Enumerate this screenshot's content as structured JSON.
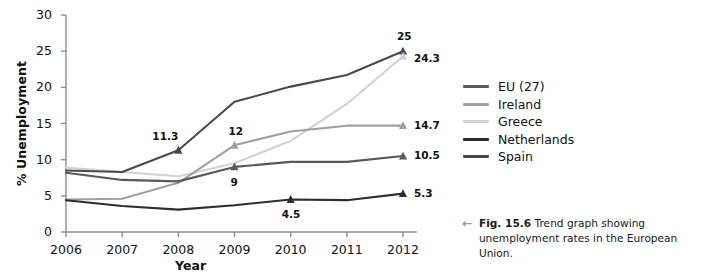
{
  "chart_data": {
    "type": "line",
    "title": "",
    "xlabel": "Year",
    "ylabel": "% Unemployment",
    "x": [
      2006,
      2007,
      2008,
      2009,
      2010,
      2011,
      2012
    ],
    "xlim": [
      2006,
      2012
    ],
    "ylim": [
      0,
      30
    ],
    "yticks": [
      0,
      5,
      10,
      15,
      20,
      25,
      30
    ],
    "xticks": [
      "2006",
      "2007",
      "2008",
      "2009",
      "2010",
      "2011",
      "2012"
    ],
    "grid": false,
    "legend_position": "right",
    "series": [
      {
        "name": "EU (27)",
        "color": "#595959",
        "values": [
          8.2,
          7.2,
          7.0,
          9.0,
          9.7,
          9.7,
          10.5
        ]
      },
      {
        "name": "Ireland",
        "color": "#a0a0a0",
        "values": [
          4.5,
          4.6,
          6.8,
          12.0,
          13.9,
          14.7,
          14.7
        ]
      },
      {
        "name": "Greece",
        "color": "#d2d2d2",
        "values": [
          8.9,
          8.3,
          7.7,
          9.5,
          12.6,
          17.7,
          24.3
        ]
      },
      {
        "name": "Netherlands",
        "color": "#2e2e2e",
        "values": [
          4.4,
          3.6,
          3.1,
          3.7,
          4.5,
          4.4,
          5.3
        ]
      },
      {
        "name": "Spain",
        "color": "#4a4a4a",
        "values": [
          8.5,
          8.3,
          11.3,
          18.0,
          20.1,
          21.7,
          25.0
        ]
      }
    ],
    "point_labels": [
      {
        "series": "Spain",
        "x": 2008,
        "value": "11.3",
        "dx": -26,
        "dy": -20
      },
      {
        "series": "Ireland",
        "x": 2009,
        "value": "12",
        "dx": -6,
        "dy": -20
      },
      {
        "series": "EU (27)",
        "x": 2009,
        "value": "9",
        "dx": -4,
        "dy": 9
      },
      {
        "series": "Netherlands",
        "x": 2010,
        "value": "4.5",
        "dx": -9,
        "dy": 9
      },
      {
        "series": "Spain",
        "x": 2012,
        "value": "25",
        "dx": -6,
        "dy": -21
      },
      {
        "series": "Greece",
        "x": 2012,
        "value": "24.3",
        "dx": 11,
        "dy": -4
      },
      {
        "series": "Ireland",
        "x": 2012,
        "value": "14.7",
        "dx": 11,
        "dy": -7
      },
      {
        "series": "EU (27)",
        "x": 2012,
        "value": "10.5",
        "dx": 11,
        "dy": -7
      },
      {
        "series": "Netherlands",
        "x": 2012,
        "value": "5.3",
        "dx": 11,
        "dy": -7
      }
    ],
    "markers": [
      {
        "series": "Spain",
        "x": 2008
      },
      {
        "series": "Ireland",
        "x": 2009
      },
      {
        "series": "EU (27)",
        "x": 2009
      },
      {
        "series": "Netherlands",
        "x": 2010
      },
      {
        "series": "Spain",
        "x": 2012
      },
      {
        "series": "Greece",
        "x": 2012
      },
      {
        "series": "Ireland",
        "x": 2012
      },
      {
        "series": "EU (27)",
        "x": 2012
      },
      {
        "series": "Netherlands",
        "x": 2012
      }
    ]
  },
  "legend": {
    "items": [
      {
        "label": "EU (27)",
        "color": "#595959"
      },
      {
        "label": "Ireland",
        "color": "#a0a0a0"
      },
      {
        "label": "Greece",
        "color": "#d2d2d2"
      },
      {
        "label": "Netherlands",
        "color": "#2e2e2e"
      },
      {
        "label": "Spain",
        "color": "#4a4a4a"
      }
    ]
  },
  "caption": {
    "arrow": "←",
    "figure_number": "Fig. 15.6",
    "text": " Trend graph showing unemployment rates in the European Union."
  },
  "axis_colors": {
    "axis_line": "#8e8e8e",
    "text": "#111111"
  }
}
